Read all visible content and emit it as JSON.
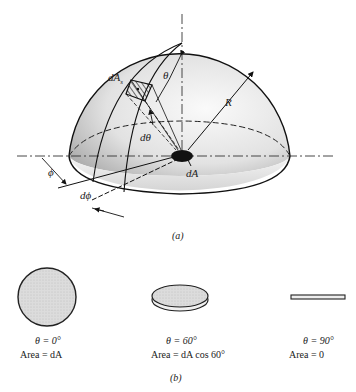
{
  "figure_a": {
    "labels": {
      "dAs": "dA",
      "dAs_sub": "s",
      "theta": "θ",
      "dtheta": "dθ",
      "R": "R",
      "phi": "ϕ",
      "dphi": "dϕ",
      "dA": "dA"
    },
    "caption": "(a)"
  },
  "figure_b": {
    "items": [
      {
        "angle": "θ = 0°",
        "area": "Area = dA",
        "shape": "circle"
      },
      {
        "angle": "θ = 60°",
        "area": "Area = dA  cos 60°",
        "shape": "tilted-disk"
      },
      {
        "angle": "θ = 90°",
        "area": "Area = 0",
        "shape": "edge-on-bar"
      }
    ],
    "caption": "(b)"
  },
  "colors": {
    "line": "#1a1a1a",
    "dome_fill_light": "#f4f4f4",
    "dome_fill_dark": "#bdbdbd",
    "disk_fill": "#d8d8d8"
  }
}
